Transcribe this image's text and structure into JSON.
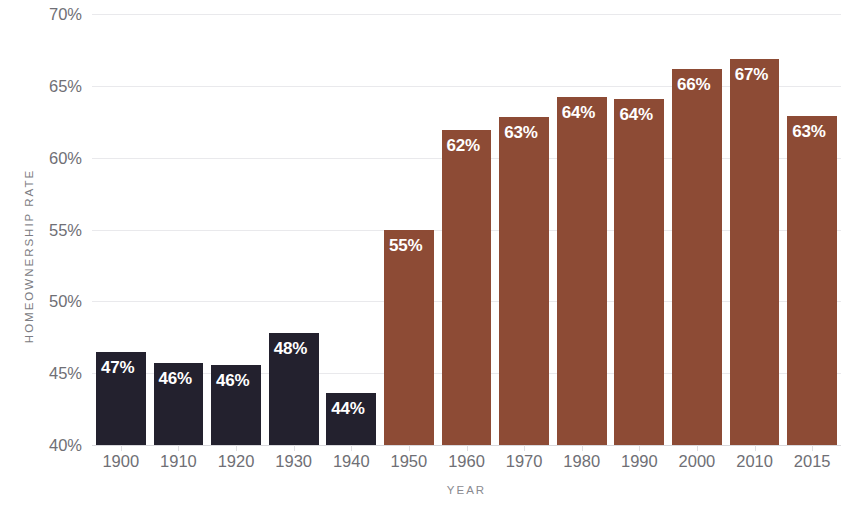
{
  "chart_data": {
    "type": "bar",
    "title": "",
    "xlabel": "YEAR",
    "ylabel": "HOMEOWNERSHIP RATE",
    "categories": [
      "1900",
      "1910",
      "1920",
      "1930",
      "1940",
      "1950",
      "1960",
      "1970",
      "1980",
      "1990",
      "2000",
      "2010",
      "2015"
    ],
    "values": [
      46.5,
      45.7,
      45.6,
      47.8,
      43.6,
      55.0,
      61.9,
      62.8,
      64.2,
      64.1,
      66.2,
      66.9,
      62.9
    ],
    "data_labels": [
      "47%",
      "46%",
      "46%",
      "48%",
      "44%",
      "55%",
      "62%",
      "63%",
      "64%",
      "64%",
      "66%",
      "67%",
      "63%"
    ],
    "bar_colors": [
      "#23212e",
      "#23212e",
      "#23212e",
      "#23212e",
      "#23212e",
      "#8d4b35",
      "#8d4b35",
      "#8d4b35",
      "#8d4b35",
      "#8d4b35",
      "#8d4b35",
      "#8d4b35",
      "#8d4b35"
    ],
    "ylim": [
      40,
      70
    ],
    "ytick_values": [
      40,
      45,
      50,
      55,
      60,
      65,
      70
    ],
    "ytick_labels": [
      "40%",
      "45%",
      "50%",
      "55%",
      "60%",
      "65%",
      "70%"
    ],
    "grid": true,
    "legend": false,
    "colors": {
      "historic_bar": "#23212e",
      "modern_bar": "#8d4b35",
      "gridline": "#e9e9ec",
      "axis_text": "#6f6f75",
      "axis_title": "#7c7c82",
      "data_label": "#ffffff",
      "background": "#ffffff"
    }
  }
}
